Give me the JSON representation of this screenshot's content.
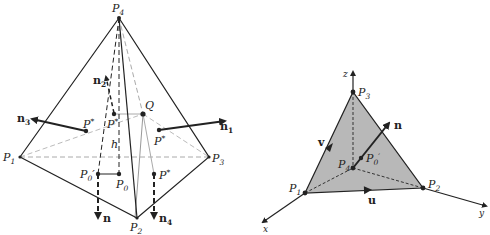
{
  "left_figure": {
    "title": "Tetrahedron with face normals",
    "points": {
      "P4": {
        "label": "P",
        "sub": "4"
      },
      "P1": {
        "label": "P",
        "sub": "1"
      },
      "P2": {
        "label": "P",
        "sub": "2"
      },
      "P3": {
        "label": "P",
        "sub": "3"
      },
      "Q": {
        "label": "Q"
      },
      "P0": {
        "label": "P",
        "sub": "0"
      },
      "P0prime": {
        "label": "P",
        "sub": "0",
        "prime": "′"
      },
      "P1star": {
        "label": "P",
        "sub": "1",
        "sup": "*"
      },
      "P2star": {
        "label": "P",
        "sub": "2",
        "sup": "*"
      },
      "P3star": {
        "label": "P",
        "sub": "3",
        "sup": "*"
      },
      "P4star": {
        "label": "P",
        "sub": "4",
        "sup": "*"
      },
      "h": {
        "label": "h"
      }
    },
    "vectors": {
      "n": {
        "label": "n"
      },
      "n1": {
        "label": "n",
        "sub": "1"
      },
      "n2": {
        "label": "n",
        "sub": "2"
      },
      "n3": {
        "label": "n",
        "sub": "3"
      },
      "n4": {
        "label": "n",
        "sub": "4"
      }
    }
  },
  "right_figure": {
    "title": "Triangle face in coordinate axes",
    "axes": {
      "x": "x",
      "y": "y",
      "z": "z"
    },
    "points": {
      "P1": {
        "label": "P",
        "sub": "1"
      },
      "P2": {
        "label": "P",
        "sub": "2"
      },
      "P3": {
        "label": "P",
        "sub": "3"
      },
      "P4": {
        "label": "P",
        "sub": "4"
      },
      "P0prime": {
        "label": "P",
        "sub": "0",
        "prime": "′"
      }
    },
    "vectors": {
      "n": {
        "label": "n"
      },
      "u": {
        "label": "u"
      },
      "v": {
        "label": "v"
      }
    },
    "face_fill": "#b8b8b8"
  },
  "colors": {
    "ink": "#222222",
    "dashed_light": "#aaaaaa",
    "face": "#b8b8b8"
  }
}
